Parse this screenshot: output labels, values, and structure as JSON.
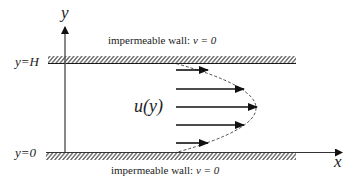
{
  "diagram": {
    "axes": {
      "y_label": "y",
      "x_label": "x"
    },
    "walls": {
      "top": {
        "position_label": "y=H",
        "caption_text": "impermeable wall: ",
        "caption_math": "v = 0"
      },
      "bottom": {
        "position_label": "y=0",
        "caption_text": "impermeable wall: ",
        "caption_math": "v = 0"
      }
    },
    "profile": {
      "label": "u(y)",
      "shape": "parabolic",
      "arrow_count": 5
    },
    "colors": {
      "ink": "#1a1a1a",
      "axis": "#555555",
      "background": "#ffffff"
    }
  }
}
